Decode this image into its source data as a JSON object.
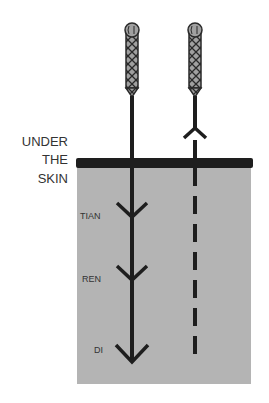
{
  "diagram": {
    "surface_label": [
      "UNDER",
      "THE",
      "SKIN"
    ],
    "depth_labels": {
      "tian": "TIAN",
      "ren": "REN",
      "di": "DI"
    },
    "colors": {
      "tissue": "#b4b4b4",
      "skin_line": "#1e1e1e",
      "needle": "#1e1e1e",
      "handle_fill": "#9a9a9a",
      "text": "#333333"
    },
    "needles": [
      {
        "name": "inserting-needle",
        "style": "solid",
        "direction": "down"
      },
      {
        "name": "withdrawing-needle",
        "style": "dashed",
        "direction": "up"
      }
    ]
  }
}
